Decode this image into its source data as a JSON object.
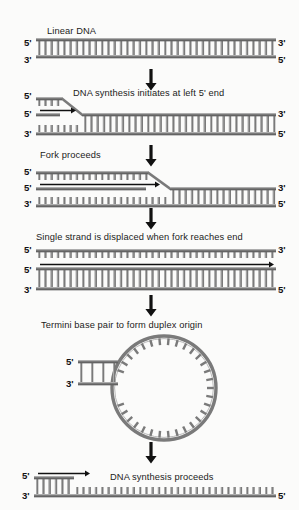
{
  "figure": {
    "background_color": "#fbfbfa",
    "strand_color": "#7a7a7a",
    "strand_dark": "#5a5a5a",
    "text_color": "#1b1b1b",
    "arrow_color": "#111111"
  },
  "steps": [
    {
      "id": "step-linear-dna",
      "caption": "Linear DNA",
      "labels": {
        "top_left": "5'",
        "bottom_left": "3'",
        "top_right": "3'",
        "bottom_right": "5'"
      }
    },
    {
      "id": "step-synthesis-initiates",
      "caption": "DNA synthesis initiates at left 5' end",
      "labels": {
        "displaced_left": "5'",
        "primer_left": "5'",
        "bottom_left": "3'",
        "top_right": "3'",
        "bottom_right": "5'"
      }
    },
    {
      "id": "step-fork-proceeds",
      "caption": "Fork proceeds",
      "labels": {
        "displaced_left": "5'",
        "primer_left": "5'",
        "bottom_left": "3'",
        "top_right": "3'",
        "bottom_right": "5'"
      }
    },
    {
      "id": "step-strand-displaced",
      "caption": "Single strand is displaced when fork reaches end",
      "labels": {
        "displaced_left": "5'",
        "displaced_right": "3'",
        "primer_left": "5'",
        "bottom_left": "3'",
        "bottom_right": "5'"
      }
    },
    {
      "id": "step-duplex-origin",
      "caption": "Termini base pair to form duplex origin",
      "labels": {
        "tail_top": "5'",
        "tail_bottom": "3'"
      }
    },
    {
      "id": "step-synthesis-proceeds",
      "caption": "DNA synthesis proceeds",
      "labels": {
        "top_left": "5'",
        "bottom_left": "3'",
        "bottom_right": "5'"
      }
    }
  ],
  "arrows": {
    "count": 5,
    "direction": "down",
    "glyph": "down-arrow"
  }
}
